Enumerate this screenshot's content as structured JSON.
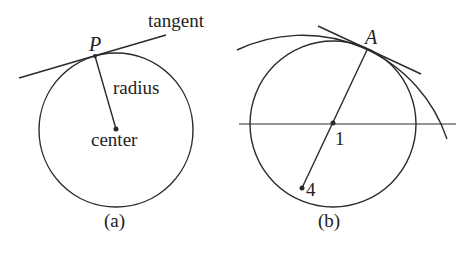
{
  "colors": {
    "stroke": "#2a2a2a",
    "text": "#222222",
    "background": "#ffffff"
  },
  "panel_a": {
    "caption": "(a)",
    "labels": {
      "tangent": "tangent",
      "point": "P",
      "radius": "radius",
      "center": "center"
    },
    "circle": {
      "cx": 116,
      "cy": 130,
      "r": 77
    },
    "point_P": {
      "x": 95,
      "y": 56
    },
    "tangent_line": {
      "x1": 19,
      "y1": 78,
      "x2": 166,
      "y2": 35
    }
  },
  "panel_b": {
    "caption": "(b)",
    "labels": {
      "point_A": "A",
      "point_1": "1",
      "point_4": "4"
    },
    "circle": {
      "cx": 333,
      "cy": 124,
      "r": 83
    },
    "large_arc": {
      "cx": 302,
      "cy": 188,
      "r": 152.5
    },
    "point_A": {
      "x": 367,
      "y": 50
    },
    "point_1": {
      "x": 333,
      "y": 124
    },
    "point_4": {
      "x": 302,
      "y": 188
    },
    "axis_line": {
      "x1": 239,
      "y1": 124,
      "x2": 456,
      "y2": 124
    },
    "tangent_line": {
      "x1": 318,
      "y1": 26,
      "x2": 421,
      "y2": 74
    }
  }
}
